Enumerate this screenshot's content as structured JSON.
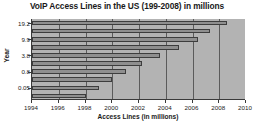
{
  "chart_data": {
    "type": "bar",
    "orientation": "horizontal",
    "title": "VoIP Access Lines in the US (199-2008) in millions",
    "xlabel": "Access Lines (in millions)",
    "ylabel": "Year",
    "xlim": [
      1994,
      2010
    ],
    "xticks": [
      1994,
      1996,
      1998,
      2000,
      2002,
      2004,
      2006,
      2008,
      2010
    ],
    "xticklabels": [
      "1994",
      "1996",
      "1998",
      "2000",
      "2002",
      "2004",
      "2006",
      "2008",
      "2010"
    ],
    "categories": [
      "19.2",
      "",
      "9.9",
      "",
      "3.8",
      "",
      "0.8",
      "",
      "0.05",
      ""
    ],
    "yticklabels": [
      "19.2",
      "9.9",
      "3.8",
      "0.8",
      "0.05"
    ],
    "values": [
      2008.6,
      2007.3,
      2006.4,
      2005.0,
      2003.6,
      2002.2,
      2001.0,
      2000.0,
      1999.0,
      1998.0
    ],
    "bar_end_years": [
      2008.6,
      2007.3,
      2006.4,
      2005.0,
      2003.6,
      2002.2,
      2001.0,
      2000.0,
      1999.0,
      1998.0
    ],
    "grid": true,
    "legend": false,
    "bar_color": "#8f8f8f",
    "plot_background": "#b3b3b3",
    "axis_color": "#3a3a3a"
  }
}
